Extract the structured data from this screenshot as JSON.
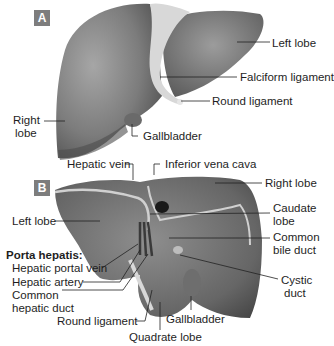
{
  "figure": {
    "panel_a": {
      "badge": "A",
      "labels": {
        "left_lobe": "Left lobe",
        "falciform_ligament": "Falciform ligament",
        "round_ligament": "Round ligament",
        "right_lobe_line1": "Right",
        "right_lobe_line2": "lobe",
        "gallbladder": "Gallbladder"
      }
    },
    "panel_b": {
      "badge": "B",
      "labels": {
        "hepatic_vein": "Hepatic vein",
        "inferior_vena_cava": "Inferior vena cava",
        "right_lobe": "Right lobe",
        "left_lobe": "Left lobe",
        "caudate_lobe_line1": "Caudate",
        "caudate_lobe_line2": "lobe",
        "common_bile_duct_line1": "Common",
        "common_bile_duct_line2": "bile duct",
        "porta_hepatis": "Porta hepatis:",
        "hepatic_portal_vein": "Hepatic portal vein",
        "hepatic_artery": "Hepatic artery",
        "common_hepatic_duct_line1": "Common",
        "common_hepatic_duct_line2": "hepatic duct",
        "cystic_duct_line1": "Cystic",
        "cystic_duct_line2": "duct",
        "round_ligament": "Round ligament",
        "gallbladder": "Gallbladder",
        "quadrate_lobe": "Quadrate lobe"
      }
    },
    "colors": {
      "badge": "#7d7d7d",
      "liver_light": "#9a9a9a",
      "liver_dark": "#5a5a5a",
      "ligament": "#d8d8d8",
      "leader_line": "#222222"
    }
  }
}
